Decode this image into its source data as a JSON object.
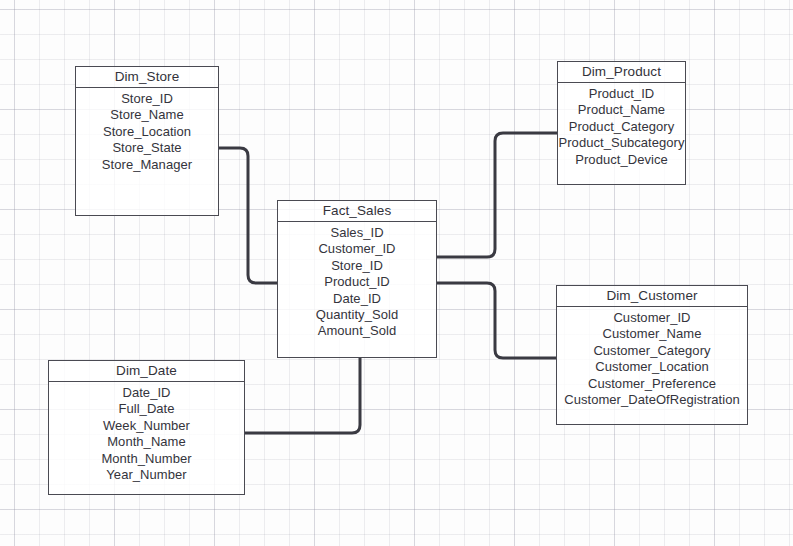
{
  "diagram": {
    "type": "star-schema",
    "entities": [
      {
        "id": "dim_store",
        "title": "Dim_Store",
        "fields": [
          "Store_ID",
          "Store_Name",
          "Store_Location",
          "Store_State",
          "Store_Manager"
        ]
      },
      {
        "id": "dim_product",
        "title": "Dim_Product",
        "fields": [
          "Product_ID",
          "Product_Name",
          "Product_Category",
          "Product_Subcategory",
          "Product_Device"
        ]
      },
      {
        "id": "fact_sales",
        "title": "Fact_Sales",
        "fields": [
          "Sales_ID",
          "Customer_ID",
          "Store_ID",
          "Product_ID",
          "Date_ID",
          "Quantity_Sold",
          "Amount_Sold"
        ]
      },
      {
        "id": "dim_customer",
        "title": "Dim_Customer",
        "fields": [
          "Customer_ID",
          "Customer_Name",
          "Customer_Category",
          "Customer_Location",
          "Customer_Preference",
          "Customer_DateOfRegistration"
        ]
      },
      {
        "id": "dim_date",
        "title": "Dim_Date",
        "fields": [
          "Date_ID",
          "Full_Date",
          "Week_Number",
          "Month_Name",
          "Month_Number",
          "Year_Number"
        ]
      }
    ],
    "relationships": [
      {
        "id": "store-to-fact",
        "from": "dim_store",
        "to": "fact_sales"
      },
      {
        "id": "product-to-fact",
        "from": "dim_product",
        "to": "fact_sales"
      },
      {
        "id": "customer-to-fact",
        "from": "dim_customer",
        "to": "fact_sales"
      },
      {
        "id": "date-to-fact",
        "from": "dim_date",
        "to": "fact_sales"
      }
    ],
    "colors": {
      "border": "#4a4a52",
      "text": "#34343c",
      "connector": "#3a3a42",
      "background": "#fdfdfd"
    }
  }
}
